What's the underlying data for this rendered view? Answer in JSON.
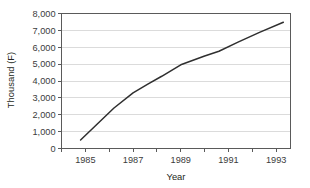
{
  "chart_data": {
    "type": "line",
    "title": "",
    "xlabel": "Year",
    "ylabel": "Thousand (F)",
    "xlim": [
      1984,
      1993.6
    ],
    "ylim": [
      0,
      8000
    ],
    "grid": true,
    "legend": false,
    "legend_position": "none",
    "line_color": "#2f2f2f",
    "grid_color": "#d2d2d2",
    "frame_color": "#5a5a5a",
    "x_tick_values": [
      1984,
      1985,
      1986,
      1987,
      1988,
      1989,
      1990,
      1991,
      1992,
      1993
    ],
    "x_tick_labels": [
      "",
      "1985",
      "",
      "1987",
      "",
      "1989",
      "",
      "1991",
      "",
      "1993"
    ],
    "y_tick_values": [
      0,
      1000,
      2000,
      3000,
      4000,
      5000,
      6000,
      7000,
      8000
    ],
    "y_tick_labels": [
      "0",
      "1,000",
      "2,000",
      "3,000",
      "4,000",
      "5,000",
      "6,000",
      "7,000",
      "8,000"
    ],
    "series": [
      {
        "name": "Thousand (F)",
        "x": [
          1984.8,
          1985.5,
          1986.2,
          1987.0,
          1987.6,
          1988.2,
          1989.0,
          1990.0,
          1990.6,
          1991.4,
          1992.3,
          1993.3
        ],
        "values": [
          500,
          1450,
          2400,
          3300,
          3800,
          4280,
          4960,
          5480,
          5760,
          6300,
          6880,
          7480
        ]
      }
    ]
  }
}
